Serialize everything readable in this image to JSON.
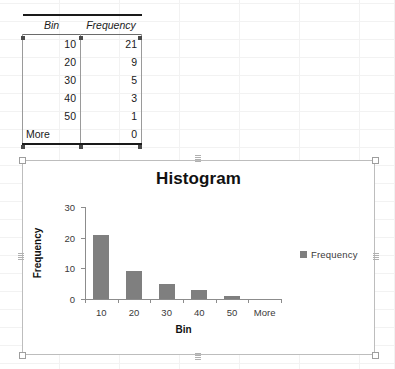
{
  "application": "spreadsheet",
  "sheet": {
    "table": {
      "headers": [
        "Bin",
        "Frequency"
      ],
      "rows": [
        {
          "bin": "10",
          "frequency": "21"
        },
        {
          "bin": "20",
          "frequency": "9"
        },
        {
          "bin": "30",
          "frequency": "5"
        },
        {
          "bin": "40",
          "frequency": "3"
        },
        {
          "bin": "50",
          "frequency": "1"
        },
        {
          "bin": "More",
          "frequency": "0"
        }
      ]
    }
  },
  "chart_data": {
    "type": "bar",
    "title": "Histogram",
    "categories": [
      "10",
      "20",
      "30",
      "40",
      "50",
      "More"
    ],
    "values": [
      21,
      9,
      5,
      3,
      1,
      0
    ],
    "series": [
      {
        "name": "Frequency",
        "values": [
          21,
          9,
          5,
          3,
          1,
          0
        ],
        "color": "#7f7f7f"
      }
    ],
    "xlabel": "Bin",
    "ylabel": "Frequency",
    "ylim": [
      0,
      30
    ],
    "yticks": [
      0,
      10,
      20,
      30
    ],
    "ytick_labels": [
      "0",
      "10",
      "20",
      "30"
    ],
    "grid": false,
    "legend": {
      "position": "right",
      "entries": [
        "Frequency"
      ]
    }
  },
  "colors": {
    "bar": "#7f7f7f",
    "axis": "#8c8c8c",
    "text": "#3a3a3a",
    "title": "#111111",
    "gridline": "#f2f2f2",
    "selection_handle": "#4a4a4a"
  }
}
